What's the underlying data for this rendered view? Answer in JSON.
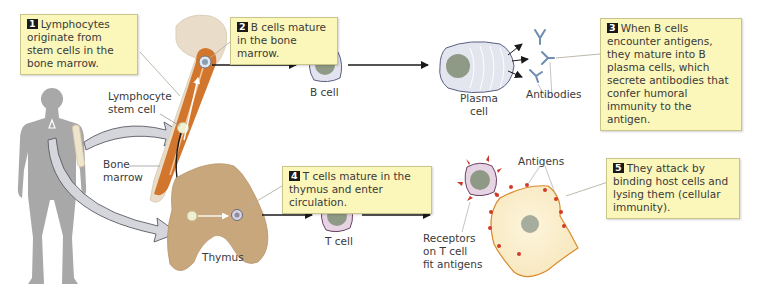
{
  "callouts": [
    {
      "num": "1",
      "text": "Lymphocytes originate from stem cells in the bone marrow."
    },
    {
      "num": "2",
      "text": "B cells mature in the bone marrow."
    },
    {
      "num": "3",
      "text": "When B cells encounter antigens, they mature into B plasma cells, which secrete antibodies that confer humoral immunity to the antigen."
    },
    {
      "num": "4",
      "text": "T cells mature in the thymus and enter circulation."
    },
    {
      "num": "5",
      "text": "They attack by binding host cells and lysing them (cellular immunity)."
    }
  ],
  "labels": {
    "lymphocyte_stem_cell_1": "Lymphocyte",
    "lymphocyte_stem_cell_2": "stem cell",
    "bone_marrow_1": "Bone",
    "bone_marrow_2": "marrow",
    "b_cell": "B cell",
    "plasma_cell_1": "Plasma",
    "plasma_cell_2": "cell",
    "antibodies": "Antibodies",
    "thymus": "Thymus",
    "t_cell": "T cell",
    "antigens": "Antigens",
    "receptors_1": "Receptors",
    "receptors_2": "on T cell",
    "receptors_3": "fit antigens"
  },
  "colors": {
    "callout_bg": "#fbf6b9",
    "bone": "#e8d6c0",
    "marrow": "#d2762e",
    "thymus": "#c9a77c",
    "body": "#a6a6a6",
    "cell_membrane_b": "#dde0ee",
    "cell_membrane_t": "#e6d3e3",
    "nucleus": "#8f9a86",
    "host_cell": "#fbf1d6",
    "antigen": "#d23a2a"
  }
}
